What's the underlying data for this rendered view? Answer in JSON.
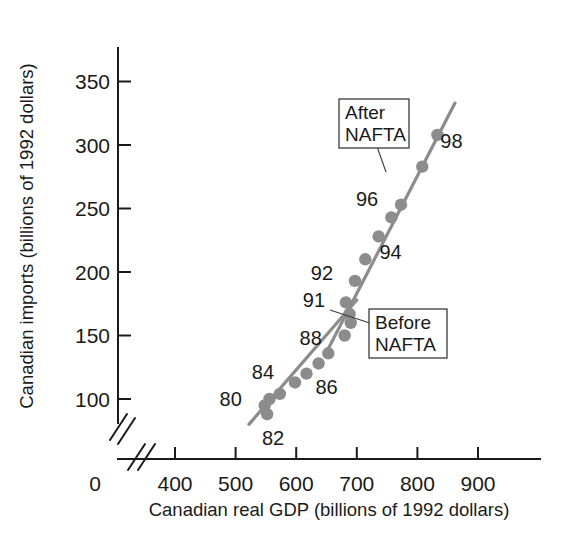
{
  "chart_data": {
    "type": "scatter",
    "title": "",
    "xlabel": "Canadian real GDP (billions of 1992 dollars)",
    "ylabel": "Canadian imports (billions of 1992 dollars)",
    "xlim": [
      400,
      950
    ],
    "ylim": [
      75,
      370
    ],
    "x_ticks": [
      0,
      400,
      500,
      600,
      700,
      800,
      900
    ],
    "y_ticks": [
      100,
      150,
      200,
      250,
      300,
      350
    ],
    "x_tick_labels": [
      "0",
      "400",
      "500",
      "600",
      "700",
      "800",
      "900"
    ],
    "y_tick_labels": [
      "100",
      "150",
      "200",
      "250",
      "300",
      "350"
    ],
    "grid": false,
    "axis_break_x": true,
    "axis_break_y": true,
    "marker_color": "#8c8c8c",
    "line_color": "#8c8c8c",
    "points": [
      {
        "label": "80",
        "x": 548,
        "y": 95,
        "label_dx": -34,
        "label_dy": -6,
        "show_label": true
      },
      {
        "label": "81",
        "x": 556,
        "y": 100,
        "label_dx": 0,
        "label_dy": 0,
        "show_label": false
      },
      {
        "label": "82",
        "x": 552,
        "y": 88,
        "label_dx": 6,
        "label_dy": 24,
        "show_label": true
      },
      {
        "label": "83",
        "x": 573,
        "y": 104,
        "label_dx": 0,
        "label_dy": 0,
        "show_label": false
      },
      {
        "label": "84",
        "x": 598,
        "y": 113,
        "label_dx": -32,
        "label_dy": -10,
        "show_label": true
      },
      {
        "label": "85",
        "x": 617,
        "y": 120,
        "label_dx": 0,
        "label_dy": 0,
        "show_label": false
      },
      {
        "label": "86",
        "x": 637,
        "y": 128,
        "label_dx": 8,
        "label_dy": 24,
        "show_label": true
      },
      {
        "label": "87",
        "x": 653,
        "y": 136,
        "label_dx": 0,
        "label_dy": 0,
        "show_label": false
      },
      {
        "label": "88",
        "x": 680,
        "y": 150,
        "label_dx": -34,
        "label_dy": 2,
        "show_label": true
      },
      {
        "label": "89",
        "x": 690,
        "y": 160,
        "label_dx": 0,
        "label_dy": 0,
        "show_label": false
      },
      {
        "label": "90",
        "x": 688,
        "y": 167,
        "label_dx": 0,
        "label_dy": 0,
        "show_label": false
      },
      {
        "label": "91",
        "x": 682,
        "y": 176,
        "label_dx": -32,
        "label_dy": -2,
        "show_label": true
      },
      {
        "label": "92",
        "x": 697,
        "y": 193,
        "label_dx": -33,
        "label_dy": -8,
        "show_label": true
      },
      {
        "label": "93",
        "x": 714,
        "y": 210,
        "label_dx": 0,
        "label_dy": 0,
        "show_label": false
      },
      {
        "label": "94",
        "x": 736,
        "y": 228,
        "label_dx": 12,
        "label_dy": 16,
        "show_label": true
      },
      {
        "label": "95",
        "x": 757,
        "y": 243,
        "label_dx": 0,
        "label_dy": 0,
        "show_label": false
      },
      {
        "label": "96",
        "x": 773,
        "y": 253,
        "label_dx": -34,
        "label_dy": -6,
        "show_label": true
      },
      {
        "label": "97",
        "x": 808,
        "y": 283,
        "label_dx": 0,
        "label_dy": 0,
        "show_label": false
      },
      {
        "label": "98",
        "x": 833,
        "y": 308,
        "label_dx": 14,
        "label_dy": 6,
        "show_label": true
      }
    ],
    "trend_lines": [
      {
        "name": "before-nafta",
        "x1": 522,
        "y1": 80,
        "x2": 700,
        "y2": 178
      },
      {
        "name": "after-nafta",
        "x1": 648,
        "y1": 135,
        "x2": 862,
        "y2": 333
      }
    ],
    "annotations": [
      {
        "name": "after-nafta",
        "lines": [
          "After",
          "NAFTA"
        ],
        "box_x": 339,
        "box_y": 99,
        "box_w": 70,
        "box_h": 49,
        "leader_x2": 386,
        "leader_y2": 172
      },
      {
        "name": "before-nafta",
        "lines": [
          "Before",
          "NAFTA"
        ],
        "box_x": 369,
        "box_y": 309,
        "box_w": 78,
        "box_h": 49,
        "leader_x2": 330,
        "leader_y2": 310
      }
    ]
  },
  "axis": {
    "x_title": "Canadian real GDP (billions of 1992 dollars)",
    "y_title": "Canadian imports (billions of 1992 dollars)"
  }
}
